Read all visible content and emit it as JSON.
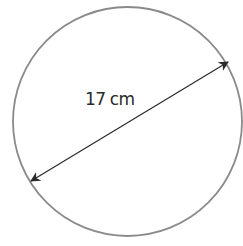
{
  "diagram": {
    "shape": "circle",
    "label": {
      "value": "17",
      "unit": "cm"
    },
    "measurement": "diameter",
    "colors": {
      "circle_stroke": "#8a8a8a",
      "arrow": "#2a2a2a",
      "text": "#2a2a2a",
      "background": "#ffffff"
    }
  }
}
